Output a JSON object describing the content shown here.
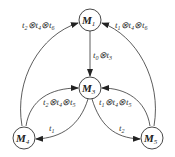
{
  "diagram": {
    "type": "state-transition-graph",
    "nodes": [
      {
        "id": "M1",
        "base": "M",
        "sub": "1"
      },
      {
        "id": "M3",
        "base": "M",
        "sub": "3"
      },
      {
        "id": "M4",
        "base": "M",
        "sub": "4"
      },
      {
        "id": "M5",
        "base": "M",
        "sub": "5"
      }
    ],
    "edges": [
      {
        "from": "M4",
        "to": "M1",
        "label": "t2⊗t4⊗t6",
        "parts": [
          {
            "b": "t",
            "s": "2"
          },
          {
            "b": "t",
            "s": "4"
          },
          {
            "b": "t",
            "s": "6"
          }
        ]
      },
      {
        "from": "M5",
        "to": "M1",
        "label": "t1⊗t4⊗t6",
        "parts": [
          {
            "b": "t",
            "s": "1"
          },
          {
            "b": "t",
            "s": "4"
          },
          {
            "b": "t",
            "s": "6"
          }
        ]
      },
      {
        "from": "M1",
        "to": "M3",
        "label": "t0⊗t3",
        "parts": [
          {
            "b": "t",
            "s": "0"
          },
          {
            "b": "t",
            "s": "3"
          }
        ]
      },
      {
        "from": "M4",
        "to": "M3",
        "label": "t2⊗t4⊗t5",
        "parts": [
          {
            "b": "t",
            "s": "2"
          },
          {
            "b": "t",
            "s": "4"
          },
          {
            "b": "t",
            "s": "5"
          }
        ]
      },
      {
        "from": "M5",
        "to": "M3",
        "label": "t1⊗t4⊗t5",
        "parts": [
          {
            "b": "t",
            "s": "1"
          },
          {
            "b": "t",
            "s": "4"
          },
          {
            "b": "t",
            "s": "5"
          }
        ]
      },
      {
        "from": "M3",
        "to": "M4",
        "label": "t1",
        "parts": [
          {
            "b": "t",
            "s": "1"
          }
        ]
      },
      {
        "from": "M3",
        "to": "M5",
        "label": "t2",
        "parts": [
          {
            "b": "t",
            "s": "2"
          }
        ]
      }
    ],
    "operator_symbol": "⊗"
  }
}
